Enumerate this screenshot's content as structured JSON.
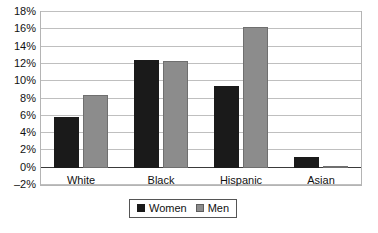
{
  "chart_data": {
    "type": "bar",
    "title": "",
    "xlabel": "",
    "ylabel": "",
    "categories": [
      "White",
      "Black",
      "Hispanic",
      "Asian"
    ],
    "series": [
      {
        "name": "Women",
        "color": "#1a1a1a",
        "values": [
          5.9,
          12.4,
          9.5,
          1.25
        ]
      },
      {
        "name": "Men",
        "color": "#8c8c8c",
        "values": [
          8.4,
          12.35,
          16.25,
          0.15
        ]
      }
    ],
    "ylim": [
      -2,
      18
    ],
    "ytick_step": 2,
    "ytick_labels": [
      "18%",
      "16%",
      "14%",
      "12%",
      "10%",
      "8%",
      "6%",
      "4%",
      "2%",
      "0%",
      "–2%"
    ],
    "ytick_values": [
      18,
      16,
      14,
      12,
      10,
      8,
      6,
      4,
      2,
      0,
      -2
    ],
    "grid": true,
    "legend_position": "bottom-center",
    "value_suffix": "%"
  }
}
